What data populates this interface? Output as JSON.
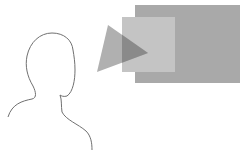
{
  "diagram": {
    "colors": {
      "outline": "#707070",
      "background_rect": "#a9a9a9",
      "foreground_rect": "#c4c4c4",
      "triangle": "#b0b0b0",
      "triangle_overlap": "#8a8a8a"
    },
    "shapes": {
      "background_rect": {
        "x": 135,
        "y": 5,
        "w": 105,
        "h": 78
      },
      "foreground_rect": {
        "x": 122,
        "y": 17,
        "w": 53,
        "h": 55
      },
      "triangle": {
        "points": "108,25 148,53 97,72"
      }
    }
  }
}
